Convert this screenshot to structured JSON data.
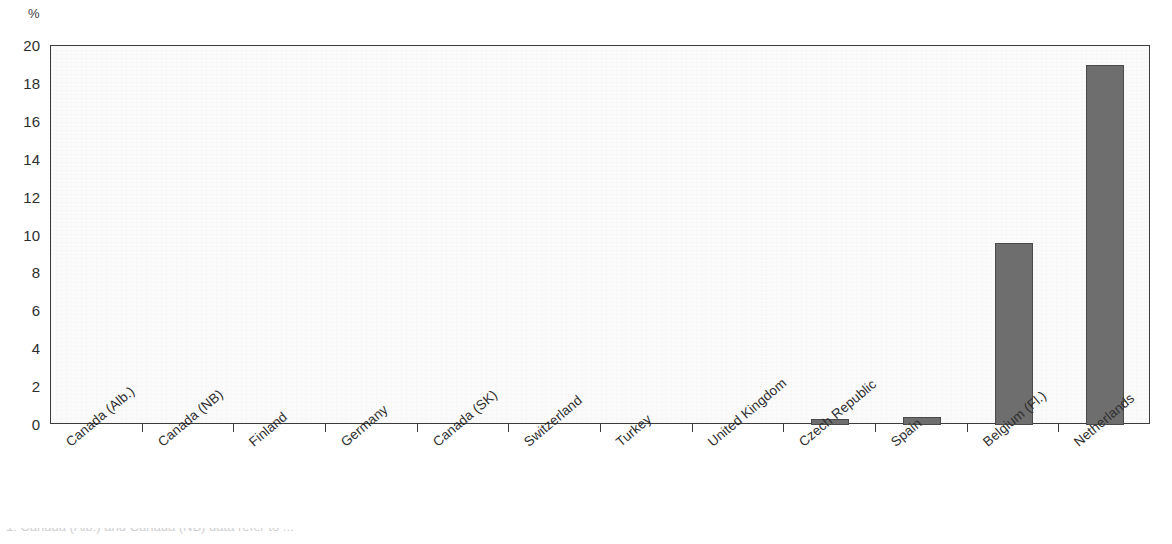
{
  "chart_data": {
    "type": "bar",
    "title": "",
    "subtitle": "",
    "xlabel": "",
    "ylabel": "%",
    "unit_label": "%",
    "ylim": [
      0,
      20
    ],
    "ytick_step": 2,
    "yticks": [
      "20",
      "18",
      "16",
      "14",
      "12",
      "10",
      "8",
      "6",
      "4",
      "2",
      "0"
    ],
    "ytick_values": [
      20,
      18,
      16,
      14,
      12,
      10,
      8,
      6,
      4,
      2,
      0
    ],
    "grid": false,
    "legend": "none",
    "bar_color": "#6e6e6e",
    "bar_edge_color": "#4a4a4a",
    "axis_color": "#3c3c3c",
    "plot_background": "#fbfbfb",
    "categories": [
      "Canada (Alb.)",
      "Canada (NB)",
      "Finland",
      "Germany",
      "Canada (SK)",
      "Switzerland",
      "Turkey",
      "United Kingdom",
      "Czech Republic",
      "Spain",
      "Belgium (Fl.)",
      "Netherlands"
    ],
    "values": [
      0,
      0,
      0,
      0,
      0,
      0,
      0,
      0,
      0.3,
      0.4,
      9.6,
      19.0
    ]
  },
  "footnote": {
    "text": "1. Canada (Alb.) and Canada (NB) data refer to ..."
  }
}
